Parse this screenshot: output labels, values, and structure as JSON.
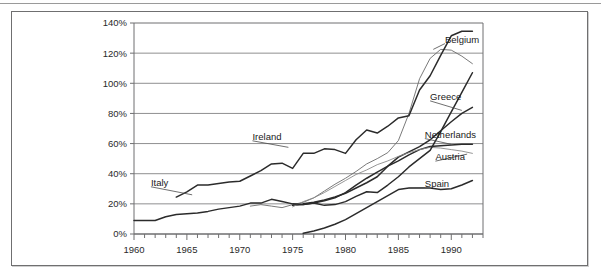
{
  "figure": {
    "border_color": "#6f6f70",
    "background": "#ffffff"
  },
  "chart_data": {
    "type": "line",
    "title": "",
    "subtitle": "",
    "xlabel": "",
    "ylabel": "",
    "xlim": [
      1960,
      1993
    ],
    "ylim": [
      0,
      140
    ],
    "grid": true,
    "grid_axis": "y",
    "legend_position": "inline-right-labels",
    "y_tick_labels": [
      "0%",
      "20%",
      "40%",
      "60%",
      "80%",
      "100%",
      "120%",
      "140%"
    ],
    "y_ticks": [
      0,
      20,
      40,
      60,
      80,
      100,
      120,
      140
    ],
    "x_tick_labels": [
      "1960",
      "1965",
      "1970",
      "1975",
      "1980",
      "1985",
      "1990"
    ],
    "x_ticks": [
      1960,
      1965,
      1970,
      1975,
      1980,
      1985,
      1990
    ],
    "x_minor_tick_step": 1,
    "series": [
      {
        "name": "Belgium",
        "color": "#6b6b6b",
        "label_x": 1989.4,
        "label_y": 127.0,
        "leader_from": [
          1988.3,
          122.5
        ],
        "x": [
          1971,
          1972,
          1973,
          1974,
          1975,
          1976,
          1977,
          1978,
          1979,
          1980,
          1981,
          1982,
          1983,
          1984,
          1985,
          1986,
          1987,
          1988,
          1989,
          1990,
          1991,
          1992
        ],
        "values": [
          18.5,
          19.5,
          18.5,
          17.5,
          19.5,
          21.0,
          24.0,
          28.5,
          33.0,
          37.0,
          41.5,
          46.5,
          50.0,
          54.0,
          62.0,
          80.0,
          103.0,
          116.5,
          122.5,
          122.0,
          118.0,
          113.0
        ]
      },
      {
        "name": "Ireland",
        "color": "#2b2b2b",
        "label_x": 1971.2,
        "label_y": 62.5,
        "leader_from": [
          1974.6,
          57.5
        ],
        "x": [
          1964,
          1965,
          1966,
          1967,
          1968,
          1969,
          1970,
          1971,
          1972,
          1973,
          1974,
          1975,
          1976,
          1977,
          1978,
          1979,
          1980,
          1981,
          1982,
          1983,
          1984,
          1985,
          1986,
          1987,
          1988,
          1989,
          1990,
          1991,
          1992
        ],
        "values": [
          24.5,
          28.0,
          32.5,
          32.5,
          33.5,
          34.5,
          35.0,
          38.5,
          42.0,
          46.5,
          47.0,
          43.5,
          53.5,
          53.5,
          56.5,
          56.0,
          53.5,
          62.5,
          69.0,
          67.0,
          71.5,
          77.0,
          78.5,
          95.5,
          105.0,
          118.5,
          131.5,
          134.5,
          134.5
        ],
        "note": "upper dark line rising to peak ~135% around 1987-1988 then falling to ~108% by 1992"
      },
      {
        "name": "Greece",
        "color": "#2b2b2b",
        "label_x": 1988.0,
        "label_y": 89.0,
        "leader_from": [
          1991.0,
          82.0
        ],
        "x": [
          1976,
          1977,
          1978,
          1979,
          1980,
          1981,
          1982,
          1983,
          1984,
          1985,
          1986,
          1987,
          1988,
          1989,
          1990,
          1991,
          1992
        ],
        "values": [
          20.0,
          21.0,
          22.5,
          24.5,
          27.0,
          30.5,
          34.0,
          38.0,
          45.0,
          51.0,
          54.5,
          58.0,
          62.5,
          68.5,
          74.5,
          80.0,
          84.0
        ]
      },
      {
        "name": "Netherlands",
        "color": "#2b2b2b",
        "label_x": 1987.5,
        "label_y": 64.0,
        "leader_from": [
          1990.0,
          59.5
        ],
        "x": [
          1975,
          1976,
          1977,
          1978,
          1979,
          1980,
          1981,
          1982,
          1983,
          1984,
          1985,
          1986,
          1987,
          1988,
          1989,
          1990,
          1991,
          1992
        ],
        "values": [
          19.0,
          19.5,
          20.5,
          22.0,
          24.0,
          27.5,
          32.5,
          37.0,
          41.0,
          45.0,
          48.5,
          52.5,
          56.0,
          58.0,
          58.5,
          59.0,
          59.5,
          59.5
        ]
      },
      {
        "name": "Austria",
        "color": "#8a8a8a",
        "label_x": 1988.5,
        "label_y": 49.0,
        "leader_from": [
          1991.5,
          53.0
        ],
        "x": [
          1975,
          1976,
          1977,
          1978,
          1979,
          1980,
          1981,
          1982,
          1983,
          1984,
          1985,
          1986,
          1987,
          1988,
          1989,
          1990,
          1991,
          1992
        ],
        "values": [
          18.0,
          21.5,
          24.0,
          27.5,
          31.5,
          35.5,
          39.5,
          42.5,
          46.0,
          48.5,
          51.5,
          54.0,
          56.0,
          57.5,
          57.0,
          56.0,
          55.0,
          53.5
        ]
      },
      {
        "name": "Spain",
        "color": "#2b2b2b",
        "label_x": 1987.5,
        "label_y": 31.5,
        "leader_from": [
          1986.0,
          30.5
        ],
        "x": [
          1976,
          1977,
          1978,
          1979,
          1980,
          1981,
          1982,
          1983,
          1984,
          1985,
          1986,
          1987,
          1988,
          1989,
          1990,
          1991,
          1992
        ],
        "values": [
          0.5,
          2.0,
          4.0,
          6.5,
          9.5,
          13.5,
          17.5,
          21.5,
          25.5,
          29.5,
          30.5,
          30.5,
          30.5,
          29.5,
          30.0,
          32.5,
          35.5
        ]
      },
      {
        "name": "Italy",
        "color": "#2b2b2b",
        "label_x": 1961.6,
        "label_y": 32.0,
        "leader_from": [
          1965.5,
          26.0
        ],
        "x": [
          1960,
          1961,
          1962,
          1963,
          1964,
          1965,
          1966,
          1967,
          1968,
          1969,
          1970,
          1971,
          1972,
          1973,
          1974,
          1975,
          1976,
          1977,
          1978,
          1979,
          1980,
          1981,
          1982,
          1983,
          1984,
          1985,
          1986,
          1987,
          1988,
          1989,
          1990,
          1991,
          1992
        ],
        "values": [
          9.0,
          9.0,
          9.0,
          11.5,
          13.0,
          13.5,
          14.0,
          15.0,
          16.5,
          17.5,
          18.5,
          20.5,
          20.5,
          23.0,
          21.5,
          20.0,
          19.5,
          20.5,
          19.0,
          19.5,
          21.5,
          25.0,
          28.0,
          27.5,
          32.5,
          38.0,
          44.5,
          50.0,
          55.5,
          68.0,
          81.0,
          94.0,
          107.0
        ],
        "note": "lowest early line merging into steeply rising line reaching ~107% in 1992"
      }
    ],
    "inline_labels": [
      "Belgium",
      "Greece",
      "Netherlands",
      "Austria",
      "Spain",
      "Ireland",
      "Italy"
    ]
  }
}
